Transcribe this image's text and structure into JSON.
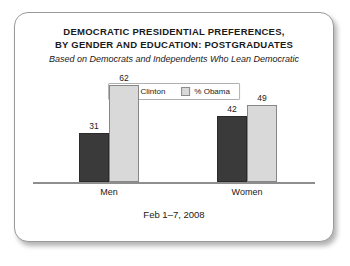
{
  "card": {
    "title_line1": "DEMOCRATIC PRESIDENTIAL PREFERENCES,",
    "title_line2": "BY GENDER AND EDUCATION: POSTGRADUATES",
    "subtitle": "Based on Democrats and Independents Who Lean Democratic",
    "footer_date": "Feb 1–7, 2008"
  },
  "legend": {
    "items": [
      {
        "label": "% Clinton",
        "color": "#3a3a3a"
      },
      {
        "label": "% Obama",
        "color": "#d9d9d9"
      }
    ]
  },
  "chart_data": {
    "type": "bar",
    "title": "DEMOCRATIC PRESIDENTIAL PREFERENCES, BY GENDER AND EDUCATION: POSTGRADUATES",
    "subtitle": "Based on Democrats and Independents Who Lean Democratic",
    "note": "Feb 1–7, 2008",
    "categories": [
      "Men",
      "Women"
    ],
    "series": [
      {
        "name": "% Clinton",
        "color": "#3a3a3a",
        "values": [
          31,
          62
        ]
      },
      {
        "name": "% Obama",
        "color": "#d9d9d9",
        "values": [
          62,
          49
        ]
      }
    ],
    "xlabel": "",
    "ylabel": "",
    "ylim": [
      0,
      70
    ],
    "grid": false,
    "legend_position": "top-center",
    "data_labels": true,
    "groups": [
      {
        "category": "Men",
        "bars": [
          {
            "series": "% Clinton",
            "value": 31,
            "label": "31"
          },
          {
            "series": "% Obama",
            "value": 62,
            "label": "62"
          }
        ]
      },
      {
        "category": "Women",
        "bars": [
          {
            "series": "% Clinton",
            "value": 42,
            "label": "42"
          },
          {
            "series": "% Obama",
            "value": 49,
            "label": "49"
          }
        ]
      }
    ]
  }
}
